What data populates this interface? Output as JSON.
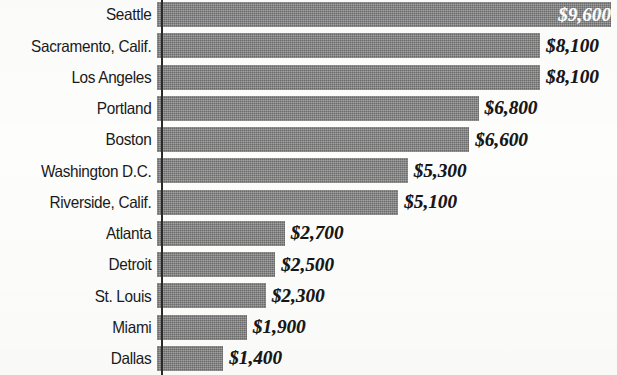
{
  "chart_data": {
    "type": "bar",
    "orientation": "horizontal",
    "title": "",
    "subtitle": "",
    "xlabel": "",
    "ylabel": "",
    "grid": false,
    "legend": null,
    "axis_line": "vertical rule at left of bars",
    "value_prefix": "$",
    "xlim": [
      0,
      9600
    ],
    "categories": [
      "Seattle",
      "Sacramento, Calif.",
      "Los Angeles",
      "Portland",
      "Boston",
      "Washington D.C.",
      "Riverside, Calif.",
      "Atlanta",
      "Detroit",
      "St. Louis",
      "Miami",
      "Dallas"
    ],
    "values": [
      9600,
      8100,
      8100,
      6800,
      6600,
      5300,
      5100,
      2700,
      2500,
      2300,
      1900,
      1400
    ],
    "value_labels": [
      "$9,600",
      "$8,100",
      "$8,100",
      "$6,800",
      "$6,600",
      "$5,300",
      "$5,100",
      "$2,700",
      "$2,500",
      "$2,300",
      "$1,900",
      "$1,400"
    ],
    "label_placement": [
      "inside",
      "outside",
      "outside",
      "outside",
      "outside",
      "outside",
      "outside",
      "outside",
      "outside",
      "outside",
      "outside",
      "outside"
    ],
    "colors": {
      "bar": "#7e7e7e",
      "axis": "#2a2a2a",
      "category_text": "#1a1a1a",
      "value_text_outside": "#161616",
      "value_text_inside": "#ffffff",
      "background": "#fdfdfc"
    }
  }
}
